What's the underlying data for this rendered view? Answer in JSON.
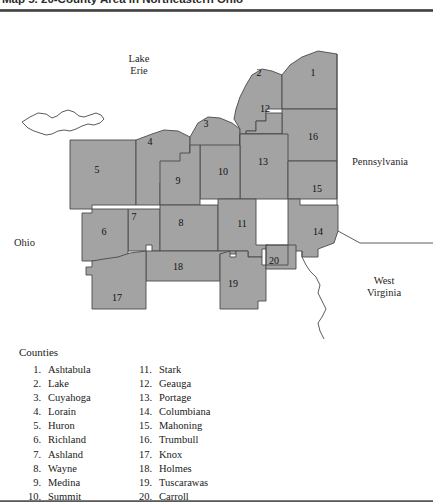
{
  "title": {
    "text": "Map 5. 20-County Area in Northeastern Ohio"
  },
  "map": {
    "fill_color": "#a3a3a3",
    "border_color": "#4a4a4a",
    "background_color": "#ffffff",
    "geo_labels": [
      {
        "name": "lake-erie",
        "text": "Lake\nErie"
      },
      {
        "name": "pennsylvania",
        "text": "Pennsylvania"
      },
      {
        "name": "ohio",
        "text": "Ohio"
      },
      {
        "name": "west-virginia",
        "text": "West\nVirginia"
      }
    ],
    "county_numbers": [
      {
        "num": "1",
        "x": 313,
        "y": 55
      },
      {
        "num": "2",
        "x": 259,
        "y": 55
      },
      {
        "num": "3",
        "x": 206,
        "y": 106
      },
      {
        "num": "4",
        "x": 150,
        "y": 124
      },
      {
        "num": "5",
        "x": 97,
        "y": 152
      },
      {
        "num": "6",
        "x": 104,
        "y": 214
      },
      {
        "num": "7",
        "x": 134,
        "y": 199
      },
      {
        "num": "8",
        "x": 181,
        "y": 205
      },
      {
        "num": "9",
        "x": 178,
        "y": 163
      },
      {
        "num": "10",
        "x": 223,
        "y": 154
      },
      {
        "num": "11",
        "x": 242,
        "y": 206
      },
      {
        "num": "12",
        "x": 265,
        "y": 91
      },
      {
        "num": "13",
        "x": 263,
        "y": 144
      },
      {
        "num": "14",
        "x": 318,
        "y": 214
      },
      {
        "num": "15",
        "x": 317,
        "y": 171
      },
      {
        "num": "16",
        "x": 313,
        "y": 119
      },
      {
        "num": "17",
        "x": 117,
        "y": 280
      },
      {
        "num": "18",
        "x": 178,
        "y": 249
      },
      {
        "num": "19",
        "x": 233,
        "y": 266
      },
      {
        "num": "20",
        "x": 274,
        "y": 243
      }
    ]
  },
  "legend": {
    "heading": "Counties",
    "left_column": [
      {
        "num": "1.",
        "name": "Ashtabula"
      },
      {
        "num": "2.",
        "name": "Lake"
      },
      {
        "num": "3.",
        "name": "Cuyahoga"
      },
      {
        "num": "4.",
        "name": "Lorain"
      },
      {
        "num": "5.",
        "name": "Huron"
      },
      {
        "num": "6.",
        "name": "Richland"
      },
      {
        "num": "7.",
        "name": "Ashland"
      },
      {
        "num": "8.",
        "name": "Wayne"
      },
      {
        "num": "9.",
        "name": "Medina"
      },
      {
        "num": "10.",
        "name": "Summit"
      }
    ],
    "right_column": [
      {
        "num": "11.",
        "name": "Stark"
      },
      {
        "num": "12.",
        "name": "Geauga"
      },
      {
        "num": "13.",
        "name": "Portage"
      },
      {
        "num": "14.",
        "name": "Columbiana"
      },
      {
        "num": "15.",
        "name": "Mahoning"
      },
      {
        "num": "16.",
        "name": "Trumbull"
      },
      {
        "num": "17.",
        "name": "Knox"
      },
      {
        "num": "18.",
        "name": "Holmes"
      },
      {
        "num": "19.",
        "name": "Tuscarawas"
      },
      {
        "num": "20.",
        "name": "Carroll"
      }
    ]
  }
}
